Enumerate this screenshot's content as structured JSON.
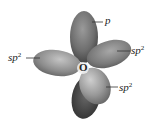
{
  "diagram": {
    "center_atom": "O",
    "labels": {
      "p": {
        "base": "p",
        "sup": ""
      },
      "sp2_left": {
        "base": "sp",
        "sup": "2"
      },
      "sp2_right": {
        "base": "sp",
        "sup": "2"
      },
      "sp2_lower": {
        "base": "sp",
        "sup": "2"
      }
    },
    "colors": {
      "lobe_light": "#b8b8b8",
      "lobe_mid": "#8a8a8a",
      "lobe_dark": "#4a4a4a",
      "leader_line": "#333333",
      "text": "#222222"
    }
  }
}
